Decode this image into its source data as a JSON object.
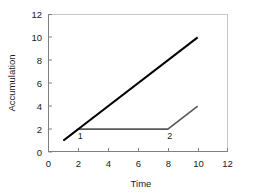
{
  "chart_data": {
    "type": "line",
    "title": "",
    "xlabel": "Time",
    "ylabel": "Accumulation",
    "xlim": [
      0,
      12
    ],
    "ylim": [
      0,
      12
    ],
    "xticks": [
      0,
      2,
      4,
      6,
      8,
      10,
      12
    ],
    "yticks": [
      0,
      2,
      4,
      6,
      8,
      10,
      12
    ],
    "grid": false,
    "legend": "none",
    "series": [
      {
        "name": "black-line",
        "color": "#000000",
        "linewidth": 2.0,
        "x": [
          1,
          10
        ],
        "y": [
          1,
          10
        ]
      },
      {
        "name": "gray-line",
        "color": "#595959",
        "linewidth": 1.6,
        "x": [
          1,
          2,
          8,
          10
        ],
        "y": [
          1,
          2,
          2,
          4
        ]
      }
    ],
    "annotations": [
      {
        "text": "1",
        "x": 2,
        "y": 2
      },
      {
        "text": "2",
        "x": 8,
        "y": 2
      }
    ]
  },
  "axis": {
    "x_tick_labels": [
      "0",
      "2",
      "4",
      "6",
      "8",
      "10",
      "12"
    ],
    "y_tick_labels": [
      "0",
      "2",
      "4",
      "6",
      "8",
      "10",
      "12"
    ],
    "x_title": "Time",
    "y_title": "Accumulation"
  },
  "colors": {
    "series_black": "#000000",
    "series_gray": "#595959",
    "axis_line": "#808080",
    "frame_line": "#c8c8c8",
    "text": "#1a1a1a",
    "background": "#ffffff"
  }
}
